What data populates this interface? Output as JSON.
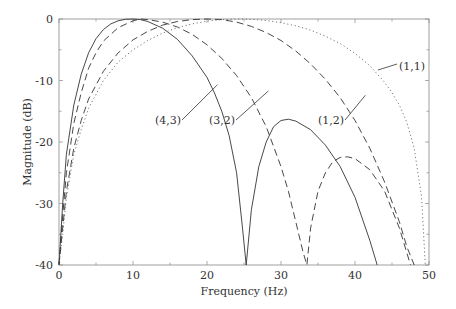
{
  "chart_data": {
    "type": "line",
    "title": "",
    "xlabel": "Frequency (Hz)",
    "ylabel": "Magnitude (dB)",
    "xlim": [
      0,
      50
    ],
    "ylim": [
      -40,
      0
    ],
    "xticks": [
      0,
      10,
      20,
      30,
      40,
      50
    ],
    "xtick_labels": [
      "0",
      "10",
      "20",
      "30",
      "40",
      "50"
    ],
    "yticks": [
      0,
      -10,
      -20,
      -30,
      -40
    ],
    "ytick_labels": [
      "0",
      "-10",
      "-20",
      "-30",
      "-40"
    ],
    "grid": false,
    "legend": "none (curves labeled by inline annotations)",
    "series": [
      {
        "name": "(4,3)",
        "style": "solid",
        "x": [
          0,
          0.5,
          1,
          2,
          3,
          4,
          5,
          6,
          7,
          8,
          9,
          10,
          11,
          12,
          14,
          16,
          18,
          20,
          21,
          22,
          23,
          24,
          24.8,
          25.3,
          26,
          27,
          28,
          29,
          30,
          31,
          32,
          34,
          36,
          38,
          40,
          42,
          43
        ],
        "y": [
          -40,
          -30,
          -22,
          -14,
          -9,
          -5.5,
          -3.2,
          -1.7,
          -0.8,
          -0.3,
          -0.05,
          0,
          -0.1,
          -0.4,
          -1.5,
          -3.3,
          -6,
          -9.5,
          -12,
          -15,
          -19,
          -25,
          -34,
          -40,
          -31,
          -24,
          -20,
          -17.5,
          -16.5,
          -16.3,
          -16.6,
          -18,
          -20.5,
          -24,
          -29,
          -36,
          -40
        ]
      },
      {
        "name": "(3,2)",
        "style": "dashed",
        "x": [
          0,
          0.5,
          1,
          2,
          3,
          4,
          5,
          6,
          8,
          10,
          11,
          12,
          14,
          16,
          18,
          20,
          22,
          24,
          26,
          28,
          30,
          31,
          32,
          33,
          33.5,
          34,
          35,
          36,
          37,
          38,
          39,
          40,
          42,
          44,
          46,
          47,
          47.5
        ],
        "y": [
          -40,
          -32,
          -25,
          -17,
          -12,
          -8,
          -5.5,
          -3.6,
          -1.4,
          -0.3,
          0,
          -0.1,
          -0.5,
          -1.3,
          -2.5,
          -4.2,
          -6.4,
          -9.2,
          -12.8,
          -17.5,
          -24,
          -28,
          -33,
          -38,
          -40,
          -34,
          -28,
          -25,
          -23.2,
          -22.5,
          -22.4,
          -22.7,
          -24.5,
          -28,
          -34,
          -38,
          -40
        ]
      },
      {
        "name": "(1,2)",
        "style": "dashed",
        "x": [
          0,
          0.5,
          1,
          2,
          3,
          4,
          6,
          8,
          10,
          12,
          14,
          16,
          18,
          20,
          22,
          24,
          26,
          28,
          30,
          32,
          34,
          36,
          38,
          40,
          42,
          44,
          46,
          47,
          48
        ],
        "y": [
          -40,
          -34,
          -28,
          -21,
          -16.5,
          -13,
          -8.5,
          -5.5,
          -3.4,
          -2,
          -1,
          -0.4,
          -0.1,
          0,
          -0.1,
          -0.5,
          -1.2,
          -2.2,
          -3.5,
          -5.2,
          -7.3,
          -9.8,
          -12.8,
          -16.5,
          -21,
          -26.5,
          -33,
          -37,
          -40
        ]
      },
      {
        "name": "(1,1)",
        "style": "dotted",
        "x": [
          0,
          0.5,
          1,
          2,
          3,
          4,
          6,
          8,
          10,
          12,
          14,
          16,
          18,
          20,
          22,
          24,
          25,
          26,
          28,
          30,
          32,
          34,
          36,
          38,
          40,
          42,
          44,
          45,
          46,
          47,
          48,
          49,
          49.5
        ],
        "y": [
          -40,
          -35,
          -29,
          -22,
          -18,
          -14.5,
          -10,
          -7,
          -5,
          -3.5,
          -2.3,
          -1.4,
          -0.8,
          -0.35,
          -0.1,
          0,
          0,
          -0.05,
          -0.25,
          -0.6,
          -1.1,
          -1.8,
          -2.8,
          -4,
          -5.6,
          -7.6,
          -10.3,
          -12,
          -14,
          -16.8,
          -21,
          -29,
          -40
        ]
      }
    ],
    "annotations": [
      {
        "text": "(4,3)",
        "text_xy": [
          17.5,
          -14.2
        ],
        "arrow_to": [
          21.4,
          -10.7
        ]
      },
      {
        "text": "(3,2)",
        "text_xy": [
          24.8,
          -14.2
        ],
        "arrow_to": [
          28.3,
          -11.7
        ]
      },
      {
        "text": "(1,2)",
        "text_xy": [
          36.9,
          -14.2
        ],
        "arrow_to": [
          41.4,
          -12.4
        ]
      },
      {
        "text": "(1,1)",
        "text_xy": [
          46.5,
          -5.2
        ],
        "arrow_to": [
          43.1,
          -8.3
        ]
      }
    ]
  },
  "labels": {
    "xlabel": "Frequency (Hz)",
    "ylabel": "Magnitude (dB)",
    "ann_43": "(4,3)",
    "ann_32": "(3,2)",
    "ann_12": "(1,2)",
    "ann_11": "(1,1)",
    "xt0": "0",
    "xt1": "10",
    "xt2": "20",
    "xt3": "30",
    "xt4": "40",
    "xt5": "50",
    "yt0": "0",
    "yt1": "-10",
    "yt2": "-20",
    "yt3": "-30",
    "yt4": "-40"
  }
}
